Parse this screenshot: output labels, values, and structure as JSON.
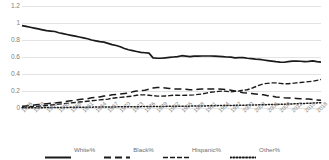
{
  "chart_data": {
    "type": "line",
    "title": "",
    "xlabel": "",
    "ylabel": "",
    "ylim": [
      0,
      1.2
    ],
    "yticks": [
      "0",
      "0.2",
      "0.4",
      "0.6",
      "0.8",
      "1",
      "1.2"
    ],
    "ytick_values": [
      0,
      0.2,
      0.4,
      0.6,
      0.8,
      1,
      1.2
    ],
    "grid": true,
    "legend_position": "bottom",
    "x": [
      1946,
      1947,
      1948,
      1949,
      1950,
      1951,
      1952,
      1953,
      1954,
      1955,
      1956,
      1957,
      1958,
      1959,
      1960,
      1961,
      1962,
      1963,
      1964,
      1965,
      1966,
      1967,
      1968,
      1969,
      1970,
      1971,
      1972,
      1973,
      1974,
      1975,
      1976,
      1977,
      1978,
      1979,
      1980,
      1981,
      1982,
      1983,
      1984,
      1985,
      1986,
      1987,
      1988,
      1989,
      1990,
      1991,
      1992,
      1993,
      1994,
      1995,
      1996,
      1997,
      1998,
      1999,
      2000,
      2001,
      2002,
      2003,
      2004,
      2005,
      2006,
      2007,
      2008,
      2009,
      2010,
      2011,
      2012,
      2013,
      2014,
      2015,
      2016,
      2017,
      2018,
      2019
    ],
    "xticks": [
      "1946",
      "1949",
      "1952",
      "1955",
      "1958",
      "1961",
      "1964",
      "1967",
      "1970",
      "1973",
      "1976",
      "1979",
      "1982",
      "1985",
      "1988",
      "1991",
      "1994",
      "1997",
      "2000",
      "2003",
      "2006",
      "2009",
      "2012",
      "2015",
      "2018"
    ],
    "series": [
      {
        "name": "White%",
        "style": "solid",
        "color": "#1a1a1a",
        "values": [
          0.97,
          0.96,
          0.95,
          0.94,
          0.93,
          0.92,
          0.91,
          0.905,
          0.9,
          0.885,
          0.875,
          0.865,
          0.855,
          0.845,
          0.835,
          0.825,
          0.815,
          0.8,
          0.79,
          0.78,
          0.775,
          0.76,
          0.745,
          0.735,
          0.72,
          0.7,
          0.685,
          0.675,
          0.665,
          0.655,
          0.65,
          0.645,
          0.59,
          0.585,
          0.585,
          0.59,
          0.595,
          0.6,
          0.605,
          0.615,
          0.61,
          0.605,
          0.61,
          0.61,
          0.612,
          0.612,
          0.612,
          0.61,
          0.608,
          0.605,
          0.6,
          0.598,
          0.59,
          0.592,
          0.593,
          0.585,
          0.58,
          0.575,
          0.572,
          0.565,
          0.558,
          0.552,
          0.545,
          0.54,
          0.538,
          0.545,
          0.552,
          0.553,
          0.55,
          0.545,
          0.548,
          0.555,
          0.545,
          0.54
        ]
      },
      {
        "name": "Black%",
        "style": "dashed",
        "color": "#1a1a1a",
        "values": [
          0.02,
          0.025,
          0.03,
          0.035,
          0.04,
          0.045,
          0.05,
          0.055,
          0.06,
          0.065,
          0.07,
          0.08,
          0.085,
          0.09,
          0.1,
          0.105,
          0.11,
          0.12,
          0.125,
          0.13,
          0.14,
          0.145,
          0.155,
          0.16,
          0.165,
          0.17,
          0.175,
          0.19,
          0.2,
          0.205,
          0.21,
          0.22,
          0.235,
          0.24,
          0.24,
          0.235,
          0.23,
          0.225,
          0.225,
          0.225,
          0.22,
          0.215,
          0.215,
          0.22,
          0.225,
          0.225,
          0.225,
          0.225,
          0.225,
          0.22,
          0.215,
          0.21,
          0.2,
          0.19,
          0.18,
          0.175,
          0.17,
          0.165,
          0.16,
          0.155,
          0.145,
          0.14,
          0.13,
          0.125,
          0.12,
          0.118,
          0.115,
          0.112,
          0.11,
          0.108,
          0.105,
          0.1,
          0.095,
          0.09
        ]
      },
      {
        "name": "Hispanic%",
        "style": "dash-dot",
        "color": "#1a1a1a",
        "values": [
          0.01,
          0.012,
          0.015,
          0.018,
          0.02,
          0.025,
          0.03,
          0.035,
          0.04,
          0.045,
          0.05,
          0.055,
          0.06,
          0.065,
          0.07,
          0.075,
          0.08,
          0.085,
          0.09,
          0.095,
          0.1,
          0.105,
          0.115,
          0.12,
          0.125,
          0.13,
          0.135,
          0.14,
          0.15,
          0.155,
          0.155,
          0.15,
          0.145,
          0.14,
          0.14,
          0.142,
          0.145,
          0.15,
          0.15,
          0.148,
          0.15,
          0.152,
          0.155,
          0.16,
          0.165,
          0.175,
          0.185,
          0.19,
          0.195,
          0.2,
          0.195,
          0.19,
          0.195,
          0.2,
          0.21,
          0.215,
          0.23,
          0.25,
          0.27,
          0.285,
          0.29,
          0.295,
          0.295,
          0.29,
          0.285,
          0.285,
          0.29,
          0.295,
          0.3,
          0.305,
          0.31,
          0.315,
          0.325,
          0.335
        ]
      },
      {
        "name": "Other%",
        "style": "dotted",
        "color": "#1a1a1a",
        "values": [
          0.002,
          0.002,
          0.003,
          0.003,
          0.004,
          0.004,
          0.005,
          0.005,
          0.006,
          0.006,
          0.007,
          0.007,
          0.008,
          0.008,
          0.009,
          0.009,
          0.01,
          0.01,
          0.011,
          0.011,
          0.012,
          0.012,
          0.013,
          0.013,
          0.014,
          0.014,
          0.015,
          0.015,
          0.016,
          0.016,
          0.017,
          0.017,
          0.018,
          0.018,
          0.019,
          0.019,
          0.02,
          0.02,
          0.021,
          0.021,
          0.022,
          0.022,
          0.023,
          0.024,
          0.025,
          0.025,
          0.026,
          0.027,
          0.028,
          0.028,
          0.029,
          0.03,
          0.031,
          0.032,
          0.033,
          0.034,
          0.035,
          0.036,
          0.038,
          0.039,
          0.04,
          0.041,
          0.042,
          0.043,
          0.044,
          0.046,
          0.048,
          0.05,
          0.052,
          0.054,
          0.056,
          0.058,
          0.06,
          0.062
        ]
      }
    ]
  }
}
